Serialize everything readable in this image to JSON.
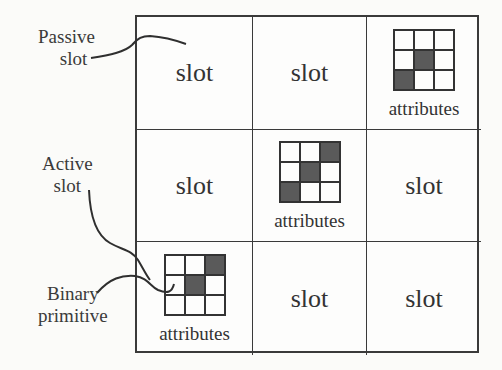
{
  "diagram": {
    "type": "slot-grid",
    "rows": 3,
    "cols": 3,
    "cells": [
      [
        {
          "kind": "slot",
          "label": "slot"
        },
        {
          "kind": "slot",
          "label": "slot"
        },
        {
          "kind": "primitive",
          "label": "attributes",
          "pattern": [
            [
              0,
              0,
              0
            ],
            [
              0,
              1,
              0
            ],
            [
              1,
              0,
              0
            ]
          ]
        }
      ],
      [
        {
          "kind": "slot",
          "label": "slot"
        },
        {
          "kind": "primitive",
          "label": "attributes",
          "pattern": [
            [
              0,
              0,
              1
            ],
            [
              0,
              1,
              0
            ],
            [
              1,
              0,
              0
            ]
          ]
        },
        {
          "kind": "slot",
          "label": "slot"
        }
      ],
      [
        {
          "kind": "primitive",
          "label": "attributes",
          "pattern": [
            [
              0,
              0,
              1
            ],
            [
              0,
              1,
              0
            ],
            [
              0,
              0,
              0
            ]
          ]
        },
        {
          "kind": "slot",
          "label": "slot"
        },
        {
          "kind": "slot",
          "label": "slot"
        }
      ]
    ]
  },
  "callouts": {
    "passive": {
      "line1": "Passive",
      "line2": "slot"
    },
    "active": {
      "line1": "Active",
      "line2": "slot"
    },
    "binary": {
      "line1": "Binary",
      "line2": "primitive"
    }
  },
  "colors": {
    "line": "#3a3a3a",
    "filled_pixel": "#5a5a5a",
    "background": "#fbfbf9"
  }
}
